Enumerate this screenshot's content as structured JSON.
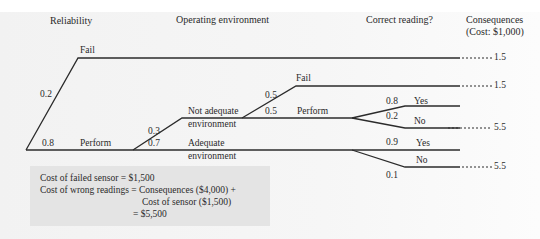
{
  "headers": {
    "reliability": "Reliability",
    "operating_environment": "Operating environment",
    "correct_reading": "Correct reading?",
    "consequences": "Consequences",
    "consequences_unit": "(Cost: $1,000)"
  },
  "tree": {
    "reliability": {
      "fail": {
        "label": "Fail",
        "probability": "0.2",
        "consequence": "1.5"
      },
      "perform": {
        "label": "Perform",
        "probability": "0.8"
      }
    },
    "environment": {
      "not_adequate": {
        "label_line1": "Not adequate",
        "label_line2": "environment",
        "probability": "0.3"
      },
      "adequate": {
        "label_line1": "Adequate",
        "label_line2": "environment",
        "probability": "0.7"
      }
    },
    "not_adequate_branch": {
      "fail": {
        "label": "Fail",
        "probability": "0.5",
        "consequence": "1.5"
      },
      "perform": {
        "label": "Perform",
        "probability": "0.5"
      },
      "reading_yes": {
        "label": "Yes",
        "probability": "0.8"
      },
      "reading_no": {
        "label": "No",
        "probability": "0.2",
        "consequence": "5.5"
      }
    },
    "adequate_branch": {
      "reading_yes": {
        "label": "Yes",
        "probability": "0.9"
      },
      "reading_no": {
        "label": "No",
        "probability": "0.1",
        "consequence": "5.5"
      }
    }
  },
  "notes": {
    "line1": "Cost of failed sensor = $1,500",
    "line2": "Cost of wrong readings = Consequences ($4,000) +",
    "line3": "Cost of sensor ($1,500)",
    "line4": "= $5,500"
  },
  "colors": {
    "line": "#2b2b2b",
    "background": "#f3f3f3",
    "note_background": "#e4e4e4"
  }
}
